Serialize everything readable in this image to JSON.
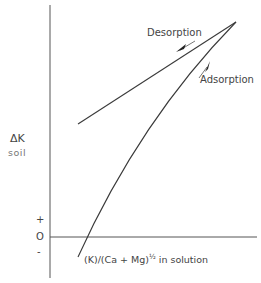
{
  "diagram": {
    "y_axis_label": "ΔK",
    "y_axis_sublabel": "soil",
    "sign_plus": "+",
    "sign_zero": "O",
    "sign_minus": "-",
    "x_axis_label_main": "(K)/(Ca + Mg)",
    "x_axis_label_exp": "½",
    "x_axis_label_tail": " in  solution",
    "curves": [
      {
        "name": "Desorption",
        "label": "Desorption",
        "shape": "straight line",
        "direction": "toward origin (down-left)"
      },
      {
        "name": "Adsorption",
        "label": "Adsorption",
        "shape": "concave curve",
        "direction": "away from origin (up-right)"
      }
    ],
    "colors": {
      "line": "#3a3a3a",
      "text": "#444444",
      "background": "#ffffff"
    }
  }
}
